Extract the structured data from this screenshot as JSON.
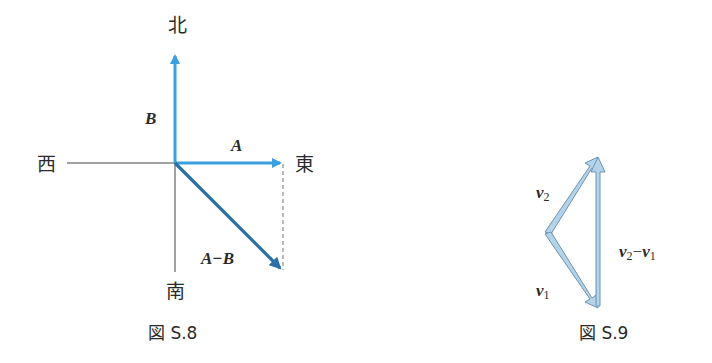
{
  "figures": [
    {
      "id": "S.8",
      "caption": "図 S.8",
      "compass": {
        "north": "北",
        "south": "南",
        "east": "東",
        "west": "西"
      },
      "vectors": [
        {
          "label": "B",
          "direction": "north",
          "color": "#3ba0e0"
        },
        {
          "label": "A",
          "direction": "east",
          "color": "#3ba0e0"
        },
        {
          "label": "A−B",
          "direction": "south-east",
          "color": "#2a6fa8"
        }
      ],
      "dashed_guide": "from tip of A straight down to tip of A−B"
    },
    {
      "id": "S.9",
      "caption": "図 S.9",
      "vectors": [
        {
          "label_main": "v",
          "label_sub": "2",
          "color": "#a9cbe3"
        },
        {
          "label_main": "v",
          "label_sub": "1",
          "color": "#a9cbe3"
        },
        {
          "label_main": "v",
          "label_sub": "2",
          "label_op": "−",
          "label_main2": "v",
          "label_sub2": "1",
          "color": "#a9cbe3"
        }
      ]
    }
  ],
  "colors": {
    "light_blue": "#3ba0e0",
    "dark_blue": "#2a6fa8",
    "pale_blue_fill": "#b3d3ea",
    "pale_blue_edge": "#6e93b0",
    "axis": "#444444",
    "text": "#2a2a2a"
  }
}
